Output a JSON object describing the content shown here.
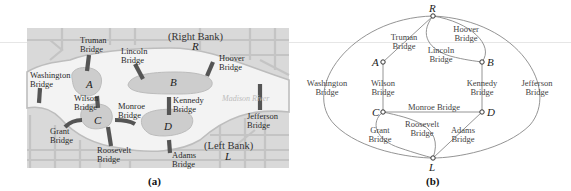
{
  "figure_a": {
    "caption": "(a)",
    "title_right_bank": "(Right Bank)",
    "title_left_bank": "(Left Bank)",
    "river_label": "Madison River",
    "colors": {
      "map_bg": "#d9d9d9",
      "river": "#f2f2f2",
      "streets": "#c2c2c2",
      "island": "#cfcfcf",
      "bridge": "#555555"
    },
    "regions": [
      {
        "id": "R",
        "label": "R"
      },
      {
        "id": "A",
        "label": "A"
      },
      {
        "id": "B",
        "label": "B"
      },
      {
        "id": "C",
        "label": "C"
      },
      {
        "id": "D",
        "label": "D"
      },
      {
        "id": "L",
        "label": "L"
      }
    ],
    "bridges": [
      {
        "name": "Truman",
        "line1": "Truman",
        "line2": "Bridge"
      },
      {
        "name": "Lincoln",
        "line1": "Lincoln",
        "line2": "Bridge"
      },
      {
        "name": "Hoover",
        "line1": "Hoover",
        "line2": "Bridge"
      },
      {
        "name": "Washington",
        "line1": "Washington",
        "line2": "Bridge"
      },
      {
        "name": "Wilson",
        "line1": "Wilson",
        "line2": "Bridge"
      },
      {
        "name": "Monroe",
        "line1": "Monroe",
        "line2": "Bridge"
      },
      {
        "name": "Kennedy",
        "line1": "Kennedy",
        "line2": "Bridge"
      },
      {
        "name": "Jefferson",
        "line1": "Jefferson",
        "line2": "Bridge"
      },
      {
        "name": "Grant",
        "line1": "Grant",
        "line2": "Bridge"
      },
      {
        "name": "Roosevelt",
        "line1": "Roosevelt",
        "line2": "Bridge"
      },
      {
        "name": "Adams",
        "line1": "Adams",
        "line2": "Bridge"
      }
    ]
  },
  "figure_b": {
    "caption": "(b)",
    "nodes": [
      {
        "id": "R",
        "label": "R"
      },
      {
        "id": "A",
        "label": "A"
      },
      {
        "id": "B",
        "label": "B"
      },
      {
        "id": "C",
        "label": "C"
      },
      {
        "id": "D",
        "label": "D"
      },
      {
        "id": "L",
        "label": "L"
      }
    ],
    "edges": [
      {
        "from": "R",
        "to": "A",
        "line1": "Truman",
        "line2": "Bridge"
      },
      {
        "from": "R",
        "to": "B",
        "line1": "Lincoln",
        "line2": "Bridge"
      },
      {
        "from": "R",
        "to": "B",
        "line1": "Hoover",
        "line2": "Bridge"
      },
      {
        "from": "R",
        "to": "L",
        "line1": "Washington",
        "line2": "Bridge"
      },
      {
        "from": "R",
        "to": "L",
        "line1": "Jefferson",
        "line2": "Bridge"
      },
      {
        "from": "A",
        "to": "C",
        "line1": "Wilson",
        "line2": "Bridge"
      },
      {
        "from": "B",
        "to": "D",
        "line1": "Kennedy",
        "line2": "Bridge"
      },
      {
        "from": "C",
        "to": "D",
        "line1": "Monroe Bridge",
        "line2": ""
      },
      {
        "from": "C",
        "to": "L",
        "line1": "Grant",
        "line2": "Bridge"
      },
      {
        "from": "C",
        "to": "L",
        "line1": "Roosevelt",
        "line2": "Bridge"
      },
      {
        "from": "D",
        "to": "L",
        "line1": "Adams",
        "line2": "Bridge"
      }
    ]
  }
}
